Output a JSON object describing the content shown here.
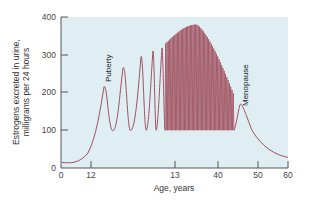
{
  "chart_data": {
    "type": "line",
    "title": "",
    "xlabel": "Age, years",
    "ylabel_line1": "Estrogens excreted in urine,",
    "ylabel_line2": "milligrams per 24 hours",
    "ylim": [
      0,
      400
    ],
    "yticks": [
      0,
      100,
      200,
      300,
      400
    ],
    "xtick_labels": [
      "0",
      "12",
      "13",
      "40",
      "50",
      "60"
    ],
    "grid": false,
    "legend": null,
    "annotations": [
      {
        "text": "Puberty",
        "near_age": "~12-13",
        "value": 220
      },
      {
        "text": "Menopause",
        "near_age": "~45",
        "value": 170
      }
    ],
    "series": [
      {
        "name": "Estrogen excretion",
        "description": "Low (~15) in childhood, rising at puberty into irregular cycles with increasing peaks (~220, 270, 300, 310, 320), then regular monthly cycles oscillating between ~100 and a peak envelope rising to ~380 then declining to ~200 before menopause, final peak ~170 then decay to ~30 by age 60",
        "points_age_value": [
          [
            0,
            15
          ],
          [
            6,
            12
          ],
          [
            10,
            30
          ],
          [
            12,
            100
          ],
          [
            13,
            220
          ],
          [
            13.5,
            90
          ],
          [
            14.5,
            270
          ],
          [
            15,
            90
          ],
          [
            16,
            300
          ],
          [
            16.5,
            100
          ],
          [
            17,
            310
          ],
          [
            17.5,
            100
          ],
          [
            18,
            320
          ],
          [
            18.5,
            100
          ],
          [
            20,
            340
          ],
          [
            25,
            380
          ],
          [
            30,
            360
          ],
          [
            35,
            300
          ],
          [
            40,
            230
          ],
          [
            43,
            200
          ],
          [
            44,
            100
          ],
          [
            45,
            170
          ],
          [
            50,
            80
          ],
          [
            55,
            45
          ],
          [
            60,
            30
          ]
        ]
      }
    ],
    "colors": {
      "line": "#a0505e",
      "plot_bg": "#dfeef3",
      "axis": "#555555"
    }
  }
}
